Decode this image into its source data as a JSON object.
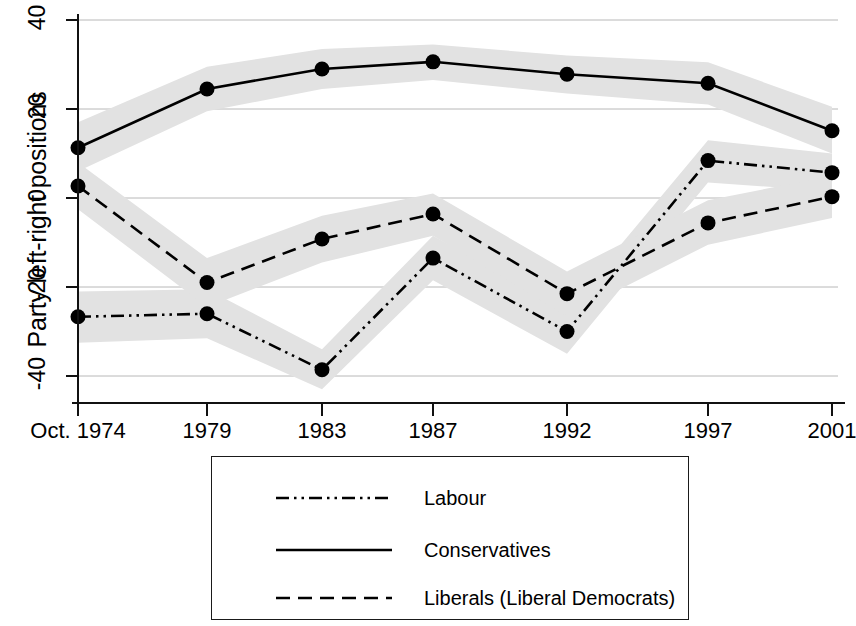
{
  "chart_data": {
    "type": "line",
    "title": "",
    "xlabel": "",
    "ylabel": "Party left-right positions",
    "x": [
      "Oct. 1974",
      "1979",
      "1983",
      "1987",
      "1992",
      "1997",
      "2001"
    ],
    "categories": [
      "Oct. 1974",
      "1979",
      "1983",
      "1987",
      "1992",
      "1997",
      "2001"
    ],
    "xtick_labels": [
      "Oct. 1974",
      "1979",
      "1983",
      "1987",
      "1992",
      "1997",
      "2001"
    ],
    "ytick_labels": [
      "40",
      "20",
      "0",
      "-20",
      "-40"
    ],
    "ytick_values": [
      40,
      20,
      0,
      -20,
      -40
    ],
    "ylim": [
      -46,
      45
    ],
    "grid": "horizontal",
    "legend_position": "below-plot",
    "series": [
      {
        "name": "Labour",
        "style": "dash-dot-dot",
        "values": [
          -26.7,
          -26.0,
          -38.6,
          -13.5,
          -30.0,
          8.4,
          5.7
        ],
        "band_lower": [
          -32.5,
          -31.5,
          -43.0,
          -18.5,
          -35.0,
          3.5,
          1.5
        ],
        "band_upper": [
          -21.0,
          -20.5,
          -34.0,
          -8.5,
          -25.0,
          13.0,
          10.0
        ]
      },
      {
        "name": "Conservatives",
        "style": "solid",
        "values": [
          11.3,
          24.5,
          29.0,
          30.6,
          27.8,
          25.8,
          15.1
        ],
        "band_lower": [
          6.0,
          19.5,
          24.5,
          26.5,
          23.5,
          21.0,
          10.0
        ],
        "band_upper": [
          17.0,
          29.5,
          33.5,
          34.5,
          32.0,
          30.5,
          20.5
        ]
      },
      {
        "name": "Liberals (Liberal Democrats)",
        "style": "dashed",
        "values": [
          2.7,
          -19.0,
          -9.2,
          -3.6,
          -21.5,
          -5.6,
          0.3
        ],
        "band_lower": [
          -2.5,
          -24.5,
          -14.5,
          -8.5,
          -26.5,
          -10.5,
          -4.5
        ],
        "band_upper": [
          8.0,
          -13.5,
          -4.0,
          1.0,
          -16.5,
          -0.5,
          5.0
        ]
      }
    ],
    "band_color": "#e2e2e2",
    "line_color": "#000000",
    "marker_color": "#000000",
    "gridline_color": "#b8b8b8"
  },
  "axes": {
    "y_label": "Party left-right positions",
    "y_ticks": [
      "40",
      "20",
      "0",
      "-20",
      "-40"
    ],
    "x_ticks": [
      "Oct. 1974",
      "1979",
      "1983",
      "1987",
      "1992",
      "1997",
      "2001"
    ]
  },
  "legend": {
    "entries": [
      {
        "label": "Labour",
        "style": "dash-dot-dot"
      },
      {
        "label": "Conservatives",
        "style": "solid"
      },
      {
        "label": "Liberals (Liberal Democrats)",
        "style": "dashed"
      }
    ]
  }
}
